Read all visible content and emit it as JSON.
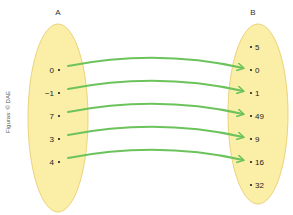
{
  "diagram": {
    "colors": {
      "set_fill": "#fbefa8",
      "set_stroke": "#ecd27a",
      "arrow": "#6cc35c",
      "text": "#222222"
    },
    "set_a": {
      "label": "A",
      "elements": [
        "0",
        "−1",
        "7",
        "3",
        "4"
      ]
    },
    "set_b": {
      "label": "B",
      "elements": [
        "5",
        "0",
        "1",
        "49",
        "9",
        "16",
        "32"
      ]
    },
    "mappings": [
      {
        "from": "0",
        "to": "0"
      },
      {
        "from": "−1",
        "to": "1"
      },
      {
        "from": "7",
        "to": "49"
      },
      {
        "from": "3",
        "to": "9"
      },
      {
        "from": "4",
        "to": "16"
      }
    ],
    "credit": "Figuras: © DAE"
  }
}
